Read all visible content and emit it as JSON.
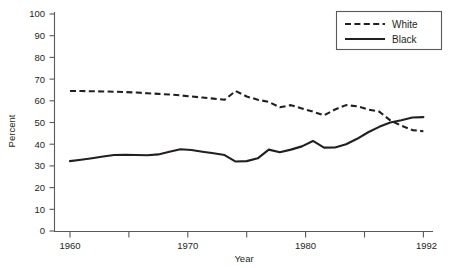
{
  "chart_data": {
    "type": "line",
    "title": "",
    "xlabel": "Year",
    "ylabel": "Percent",
    "xlim": [
      1959,
      1992
    ],
    "ylim": [
      0,
      100
    ],
    "grid": false,
    "legend_position": "top-right",
    "x_ticks": [
      1960,
      1965,
      1970,
      1975,
      1980,
      1985,
      1990,
      1992
    ],
    "x_tick_labels": [
      "1960",
      "",
      "1970",
      "",
      "1980",
      "",
      "",
      "1992"
    ],
    "y_ticks": [
      0,
      10,
      20,
      30,
      40,
      50,
      60,
      70,
      80,
      90,
      100
    ],
    "y_tick_labels": [
      "0",
      "10",
      "20",
      "30",
      "40",
      "50",
      "60",
      "70",
      "80",
      "90",
      "100"
    ],
    "x": [
      1960,
      1961,
      1962,
      1963,
      1964,
      1965,
      1966,
      1967,
      1968,
      1969,
      1970,
      1971,
      1972,
      1973,
      1974,
      1975,
      1976,
      1977,
      1978,
      1979,
      1980,
      1981,
      1982,
      1983,
      1984,
      1985,
      1986,
      1987,
      1988,
      1989,
      1990,
      1991,
      1992
    ],
    "series": [
      {
        "name": "White",
        "style": "dashed",
        "color": "#231f20",
        "values": [
          64.5,
          64.5,
          64.4,
          64.3,
          64.2,
          64.0,
          63.8,
          63.5,
          63.2,
          62.9,
          62.5,
          62.0,
          61.5,
          61.0,
          60.5,
          64.5,
          62.0,
          60.5,
          59.5,
          57.0,
          58.0,
          56.5,
          55.0,
          53.3,
          56.0,
          58.0,
          57.5,
          56.0,
          55.0,
          51.0,
          48.5,
          46.5,
          46.0
        ]
      },
      {
        "name": "Black",
        "style": "solid",
        "color": "#231f20",
        "values": [
          32.2,
          32.8,
          33.5,
          34.3,
          35.0,
          35.1,
          35.0,
          34.9,
          35.3,
          36.5,
          37.7,
          37.3,
          36.5,
          35.8,
          35.0,
          32.0,
          32.2,
          33.5,
          37.5,
          36.3,
          37.5,
          39.0,
          41.5,
          38.4,
          38.5,
          40.0,
          42.5,
          45.5,
          48.0,
          50.0,
          51.0,
          52.3,
          52.5
        ]
      }
    ],
    "legend": [
      "White",
      "Black"
    ]
  },
  "axes": {
    "x_axis_title": "Year",
    "y_axis_title": "Percent"
  },
  "legend": {
    "items": [
      {
        "label": "White",
        "style": "dashed"
      },
      {
        "label": "Black",
        "style": "solid"
      }
    ]
  },
  "footer": {
    "caption": ""
  }
}
